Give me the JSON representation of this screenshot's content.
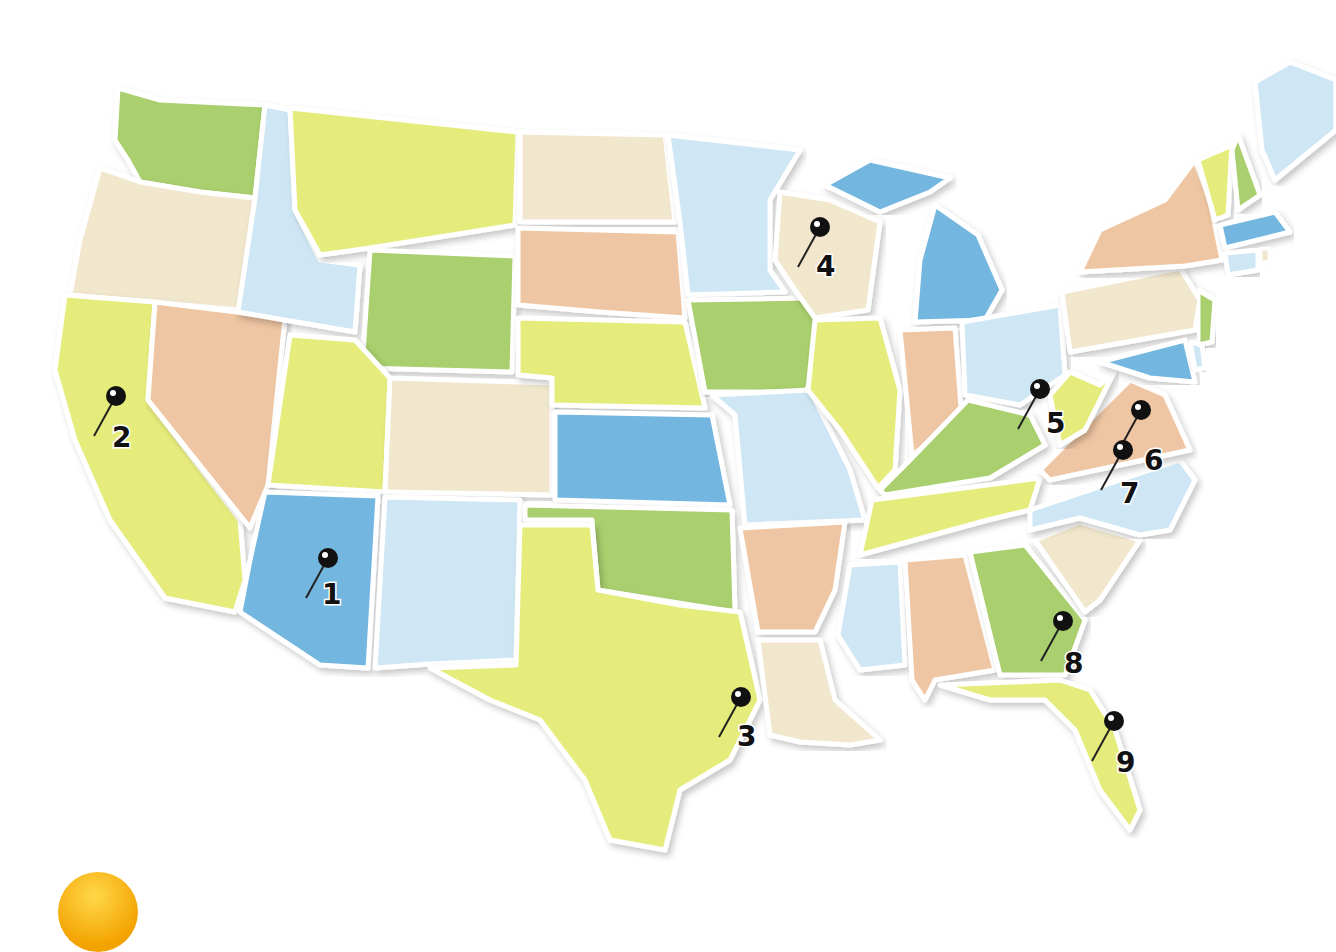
{
  "map": {
    "title": "United States map with numbered pins",
    "colors": {
      "green": "#a9cf6e",
      "yellow": "#e6ec7c",
      "cream": "#f1e7cc",
      "peach": "#efc6a3",
      "lightblue": "#cfe7f4",
      "blue": "#73b6e0",
      "pin": "#111111",
      "decoration": "#f5b515"
    },
    "pins": [
      {
        "label": "1",
        "state": "Arizona",
        "x": 328,
        "y": 558,
        "lx": 322,
        "ly": 604
      },
      {
        "label": "2",
        "state": "California",
        "x": 116,
        "y": 396,
        "lx": 112,
        "ly": 447
      },
      {
        "label": "3",
        "state": "Texas",
        "x": 741,
        "y": 697,
        "lx": 737,
        "ly": 746
      },
      {
        "label": "4",
        "state": "Wisconsin",
        "x": 820,
        "y": 227,
        "lx": 816,
        "ly": 276
      },
      {
        "label": "5",
        "state": "West Virginia",
        "x": 1040,
        "y": 389,
        "lx": 1046,
        "ly": 433
      },
      {
        "label": "6",
        "state": "Virginia",
        "x": 1141,
        "y": 410,
        "lx": 1144,
        "ly": 470
      },
      {
        "label": "7",
        "state": "North Carolina",
        "x": 1123,
        "y": 450,
        "lx": 1120,
        "ly": 503
      },
      {
        "label": "8",
        "state": "Georgia",
        "x": 1063,
        "y": 621,
        "lx": 1064,
        "ly": 673
      },
      {
        "label": "9",
        "state": "Florida",
        "x": 1114,
        "y": 721,
        "lx": 1116,
        "ly": 772
      }
    ]
  }
}
